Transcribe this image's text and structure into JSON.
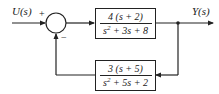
{
  "diagram": {
    "type": "feedback-control-block-diagram",
    "input": {
      "label": "U(s)"
    },
    "output": {
      "label": "Y(s)"
    },
    "summing_junction": {
      "plus_sign": "+",
      "minus_sign": "−"
    },
    "forward_block": {
      "numerator": "4 (s + 2)",
      "denominator_parts": {
        "s": "s",
        "exp": "2",
        "rest": " + 3s + 8"
      }
    },
    "feedback_block": {
      "numerator": "3 (s + 5)",
      "denominator_parts": {
        "s": "s",
        "exp": "2",
        "rest": " + 5s + 2"
      }
    },
    "colors": {
      "line": "#222222",
      "background": "#ffffff"
    }
  }
}
